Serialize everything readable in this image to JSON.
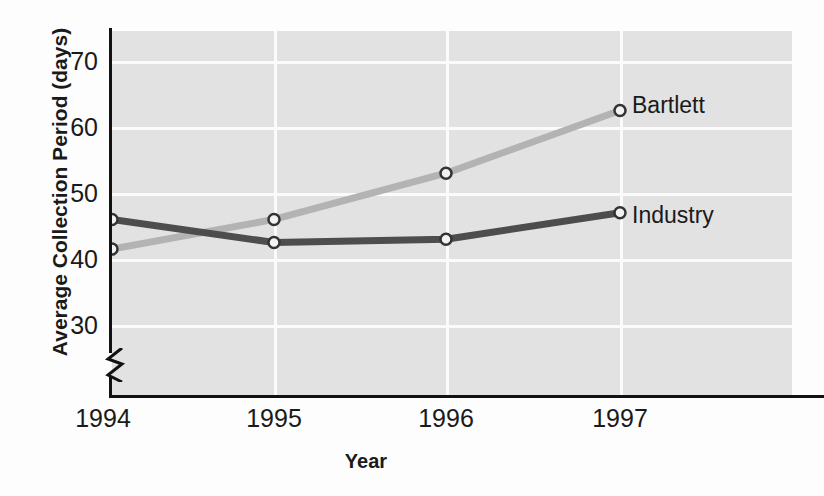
{
  "chart_data": {
    "type": "line",
    "title": "",
    "xlabel": "Year",
    "ylabel": "Average Collection Period (days)",
    "categories": [
      "1994",
      "1995",
      "1996",
      "1997"
    ],
    "x": [
      1994,
      1995,
      1996,
      1997
    ],
    "series": [
      {
        "name": "Bartlett",
        "values": [
          41.5,
          46,
          53,
          62.5
        ],
        "color": "#b3b3b3",
        "marker": "open-circle"
      },
      {
        "name": "Industry",
        "values": [
          46,
          42.5,
          43,
          47
        ],
        "color": "#4d4d4d",
        "marker": "open-circle"
      }
    ],
    "ylim": [
      26,
      74
    ],
    "yticks": [
      30,
      40,
      50,
      60,
      70
    ],
    "ytick_labels": [
      "30",
      "40",
      "50",
      "60",
      "70"
    ],
    "xticks": [
      1994,
      1995,
      1996,
      1997
    ],
    "grid": true,
    "grid_color": "#fbfbfb",
    "plot_background": "#e2e2e2",
    "axis_break": true,
    "legend_position": "inline-right-of-last-point"
  },
  "axes": {
    "y_title": "Average Collection Period (days)",
    "x_title": "Year"
  },
  "y_ticks": [
    {
      "label": "70",
      "value": 70
    },
    {
      "label": "60",
      "value": 60
    },
    {
      "label": "50",
      "value": 50
    },
    {
      "label": "40",
      "value": 40
    },
    {
      "label": "30",
      "value": 30
    }
  ],
  "x_ticks": [
    {
      "label": "1994",
      "value": 1994
    },
    {
      "label": "1995",
      "value": 1995
    },
    {
      "label": "1996",
      "value": 1996
    },
    {
      "label": "1997",
      "value": 1997
    }
  ],
  "series_labels": {
    "bartlett": "Bartlett",
    "industry": "Industry"
  },
  "colors": {
    "bartlett_line": "#b3b3b3",
    "industry_line": "#4d4d4d",
    "plot_bg": "#e2e2e2",
    "gridline": "#fbfbfb",
    "axis": "#111111",
    "text": "#1a1a1a",
    "page_bg": "#fdfdfd"
  }
}
